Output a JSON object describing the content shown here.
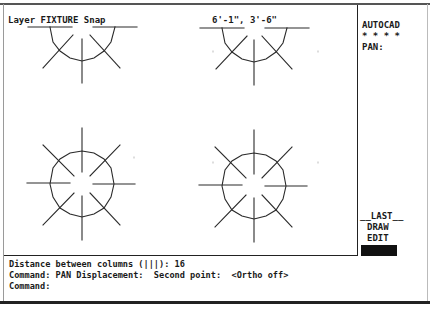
{
  "status": {
    "layer_label": "Layer FIXTURE Snap",
    "coordinates": "6'-1\", 3'-6\""
  },
  "screen_menu": {
    "title": "AUTOCAD",
    "separator": "* * * *",
    "current_command": "PAN:",
    "items": [
      {
        "label": "__LAST__"
      },
      {
        "label": "DRAW"
      },
      {
        "label": "EDIT"
      }
    ],
    "highlighted_item": ""
  },
  "command_area": {
    "lines": [
      "Distance between columns (|||): 16",
      "Command: PAN Displacement:  Second point:  <Ortho off>",
      "Command:"
    ]
  },
  "drawing": {
    "fixtures": [
      {
        "type": "half-round",
        "cx": 82,
        "cy": 27
      },
      {
        "type": "half-round",
        "cx": 254,
        "cy": 27
      },
      {
        "type": "round",
        "cx": 82,
        "cy": 184
      },
      {
        "type": "round",
        "cx": 254,
        "cy": 186
      }
    ],
    "stroke_color": "#2a2a2a"
  }
}
